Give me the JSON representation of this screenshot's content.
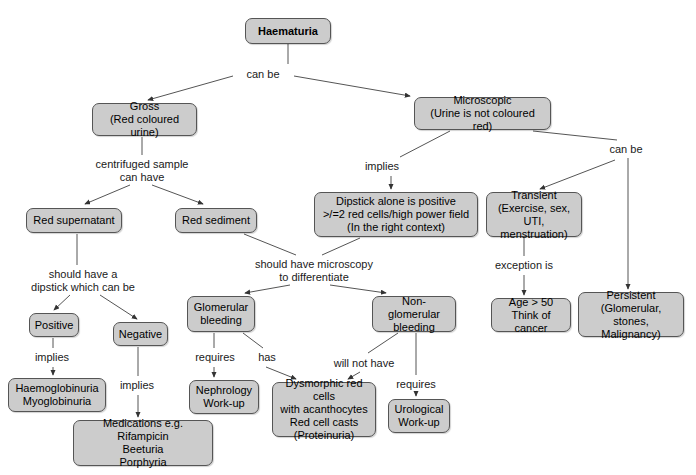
{
  "diagram": {
    "title": "Haematuria",
    "style": {
      "node_fill": "#cccccc",
      "node_border": "#555555",
      "edge_color": "#555555",
      "text_color": "#000000",
      "background": "#ffffff"
    },
    "nodes": [
      {
        "id": "haematuria",
        "label": "Haematuria",
        "x": 245,
        "y": 18,
        "w": 86,
        "h": 26,
        "bold": true
      },
      {
        "id": "gross",
        "label": "Gross\n(Red coloured urine)",
        "x": 92,
        "y": 103,
        "w": 105,
        "h": 33,
        "bold": false
      },
      {
        "id": "microscopic",
        "label": "Microscopic\n(Urine is not coloured red)",
        "x": 414,
        "y": 97,
        "w": 137,
        "h": 33,
        "bold": false
      },
      {
        "id": "red-supernatant",
        "label": "Red supernatant",
        "x": 26,
        "y": 208,
        "w": 96,
        "h": 25,
        "bold": false
      },
      {
        "id": "red-sediment",
        "label": "Red sediment",
        "x": 175,
        "y": 208,
        "w": 82,
        "h": 25,
        "bold": false
      },
      {
        "id": "dipstick",
        "label": "Dipstick alone is positive\n>/=2 red cells/high power field\n(In the right context)",
        "x": 314,
        "y": 192,
        "w": 164,
        "h": 45,
        "bold": false
      },
      {
        "id": "transient",
        "label": "Transient\n(Exercise, sex,\nUTI, menstruation)",
        "x": 486,
        "y": 192,
        "w": 96,
        "h": 45,
        "bold": false
      },
      {
        "id": "positive",
        "label": "Positive",
        "x": 29,
        "y": 313,
        "w": 50,
        "h": 24,
        "bold": false
      },
      {
        "id": "negative",
        "label": "Negative",
        "x": 113,
        "y": 322,
        "w": 55,
        "h": 24,
        "bold": false
      },
      {
        "id": "glomerular",
        "label": "Glomerular\nbleeding",
        "x": 187,
        "y": 296,
        "w": 68,
        "h": 36,
        "bold": false
      },
      {
        "id": "non-glomerular",
        "label": "Non-glomerular\nbleeding",
        "x": 372,
        "y": 296,
        "w": 84,
        "h": 36,
        "bold": false
      },
      {
        "id": "age-50",
        "label": "Age > 50\nThink of cancer",
        "x": 491,
        "y": 298,
        "w": 80,
        "h": 34,
        "bold": false
      },
      {
        "id": "persistent",
        "label": "Persistent\n(Glomerular, stones,\nMalignancy)",
        "x": 578,
        "y": 292,
        "w": 106,
        "h": 45,
        "bold": false
      },
      {
        "id": "haemoglobinuria",
        "label": "Haemoglobinuria\nMyoglobinuria",
        "x": 8,
        "y": 378,
        "w": 98,
        "h": 34,
        "bold": false
      },
      {
        "id": "nephrology",
        "label": "Nephrology\nWork-up",
        "x": 189,
        "y": 380,
        "w": 70,
        "h": 34,
        "bold": false
      },
      {
        "id": "dysmorphic",
        "label": "Dysmorphic red cells\nwith acanthocytes\nRed cell casts\n(Proteinuria)",
        "x": 272,
        "y": 382,
        "w": 104,
        "h": 55,
        "bold": false
      },
      {
        "id": "urological",
        "label": "Urological\nWork-up",
        "x": 388,
        "y": 399,
        "w": 62,
        "h": 34,
        "bold": false
      },
      {
        "id": "medications",
        "label": "Medications e.g. Rifampicin\nBeeturia\nPorphyria",
        "x": 73,
        "y": 420,
        "w": 140,
        "h": 46,
        "bold": false
      }
    ],
    "edge_labels": [
      {
        "id": "can-be-1",
        "text": "can be",
        "x": 233,
        "y": 68,
        "w": 60
      },
      {
        "id": "centrifuged",
        "text": "centrifuged sample\ncan have",
        "x": 84,
        "y": 158,
        "w": 116
      },
      {
        "id": "implies-1",
        "text": "implies",
        "x": 358,
        "y": 160,
        "w": 48
      },
      {
        "id": "can-be-2",
        "text": "can be",
        "x": 601,
        "y": 143,
        "w": 50
      },
      {
        "id": "should-dipstick",
        "text": "should have a\ndipstick which can be",
        "x": 18,
        "y": 268,
        "w": 130
      },
      {
        "id": "should-micro",
        "text": "should have microscopy\nto differentiate",
        "x": 248,
        "y": 258,
        "w": 132
      },
      {
        "id": "exception-is",
        "text": "exception is",
        "x": 486,
        "y": 259,
        "w": 76
      },
      {
        "id": "implies-2",
        "text": "implies",
        "x": 28,
        "y": 351,
        "w": 48
      },
      {
        "id": "implies-3",
        "text": "implies",
        "x": 113,
        "y": 379,
        "w": 48
      },
      {
        "id": "requires-1",
        "text": "requires",
        "x": 189,
        "y": 351,
        "w": 52
      },
      {
        "id": "has",
        "text": "has",
        "x": 252,
        "y": 351,
        "w": 30
      },
      {
        "id": "will-not-have",
        "text": "will not have",
        "x": 328,
        "y": 357,
        "w": 72
      },
      {
        "id": "requires-2",
        "text": "requires",
        "x": 390,
        "y": 378,
        "w": 52
      }
    ],
    "edges": [
      {
        "id": "haematuria-to-hub",
        "from": "haematuria",
        "to": "can-be-1",
        "path": "M 288,44 L 288,64",
        "arrow": false
      },
      {
        "id": "hub-to-gross",
        "from": "can-be-1",
        "to": "gross",
        "path": "M 233,76 L 148,100",
        "arrow": true
      },
      {
        "id": "hub-to-microscopic",
        "from": "can-be-1",
        "to": "microscopic",
        "path": "M 294,76 L 410,96",
        "arrow": true
      },
      {
        "id": "gross-to-centrifuged",
        "from": "gross",
        "to": "centrifuged",
        "path": "M 142,137 L 142,155",
        "arrow": false
      },
      {
        "id": "centrifuged-to-supernatant",
        "from": "centrifuged",
        "to": "red-supernatant",
        "path": "M 130,185 L 85,204",
        "arrow": true
      },
      {
        "id": "centrifuged-to-sediment",
        "from": "centrifuged",
        "to": "red-sediment",
        "path": "M 152,185 L 203,204",
        "arrow": true
      },
      {
        "id": "microscopic-to-implies",
        "from": "microscopic",
        "to": "implies-1",
        "path": "M 450,131 L 400,157",
        "arrow": false
      },
      {
        "id": "implies-to-dipstick",
        "from": "implies-1",
        "to": "dipstick",
        "path": "M 391,176 L 391,189",
        "arrow": true
      },
      {
        "id": "microscopic-to-canbe2",
        "from": "microscopic",
        "to": "can-be-2",
        "path": "M 533,131 L 617,140",
        "arrow": false
      },
      {
        "id": "canbe2-to-transient",
        "from": "can-be-2",
        "to": "transient",
        "path": "M 615,160 L 540,189",
        "arrow": true
      },
      {
        "id": "canbe2-to-persistent",
        "from": "can-be-2",
        "to": "persistent",
        "path": "M 628,158 L 628,289",
        "arrow": true
      },
      {
        "id": "supernatant-to-dipstickq",
        "from": "red-supernatant",
        "to": "should-dipstick",
        "path": "M 77,234 L 77,265",
        "arrow": false
      },
      {
        "id": "dipstickq-to-positive",
        "from": "should-dipstick",
        "to": "positive",
        "path": "M 70,295 L 54,310",
        "arrow": true
      },
      {
        "id": "dipstickq-to-negative",
        "from": "should-dipstick",
        "to": "negative",
        "path": "M 100,295 L 137,319",
        "arrow": true
      },
      {
        "id": "sediment-to-shouldmicro",
        "from": "red-sediment",
        "to": "should-micro",
        "path": "M 244,234 L 296,255",
        "arrow": false
      },
      {
        "id": "dipstick-to-shouldmicro",
        "from": "dipstick",
        "to": "should-micro",
        "path": "M 360,238 L 322,255",
        "arrow": false
      },
      {
        "id": "shouldmicro-to-glomerular",
        "from": "should-micro",
        "to": "glomerular",
        "path": "M 290,285 L 245,293",
        "arrow": true
      },
      {
        "id": "shouldmicro-to-nonglom",
        "from": "should-micro",
        "to": "non-glomerular",
        "path": "M 330,285 L 386,293",
        "arrow": true
      },
      {
        "id": "transient-to-exception",
        "from": "transient",
        "to": "exception-is",
        "path": "M 524,238 L 524,256",
        "arrow": false
      },
      {
        "id": "exception-to-age50",
        "from": "exception-is",
        "to": "age-50",
        "path": "M 524,275 L 524,295",
        "arrow": true
      },
      {
        "id": "positive-to-implies2",
        "from": "positive",
        "to": "implies-2",
        "path": "M 53,338 L 53,348",
        "arrow": false
      },
      {
        "id": "implies2-to-haemoglob",
        "from": "implies-2",
        "to": "haemoglobinuria",
        "path": "M 53,367 L 53,375",
        "arrow": true
      },
      {
        "id": "negative-to-implies3",
        "from": "negative",
        "to": "implies-3",
        "path": "M 138,347 L 138,376",
        "arrow": false
      },
      {
        "id": "implies3-to-medications",
        "from": "implies-3",
        "to": "medications",
        "path": "M 138,395 L 138,417",
        "arrow": true
      },
      {
        "id": "glomerular-to-requires1",
        "from": "glomerular",
        "to": "requires-1",
        "path": "M 214,333 L 214,348",
        "arrow": false
      },
      {
        "id": "requires1-to-nephrology",
        "from": "requires-1",
        "to": "nephrology",
        "path": "M 214,367 L 214,377",
        "arrow": true
      },
      {
        "id": "glomerular-to-has",
        "from": "glomerular",
        "to": "has",
        "path": "M 243,333 L 263,348",
        "arrow": false
      },
      {
        "id": "has-to-dysmorphic",
        "from": "has",
        "to": "dysmorphic",
        "path": "M 266,367 L 296,379",
        "arrow": true
      },
      {
        "id": "nonglom-to-willnot",
        "from": "non-glomerular",
        "to": "will-not-have",
        "path": "M 398,333 L 368,353",
        "arrow": false
      },
      {
        "id": "willnot-to-dysmorphic",
        "from": "will-not-have",
        "to": "dysmorphic",
        "path": "M 360,372 L 348,379",
        "arrow": true
      },
      {
        "id": "nonglom-to-requires2",
        "from": "non-glomerular",
        "to": "requires-2",
        "path": "M 416,333 L 416,375",
        "arrow": false
      },
      {
        "id": "requires2-to-urological",
        "from": "requires-2",
        "to": "urological",
        "path": "M 416,394 L 416,396",
        "arrow": true
      }
    ]
  }
}
